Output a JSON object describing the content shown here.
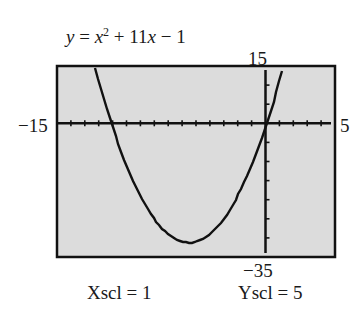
{
  "chart_data": {
    "type": "line",
    "function": "x^2 + 11x - 1",
    "equation_parts": {
      "y": "y",
      "eq": " = ",
      "x": "x",
      "exp": "2",
      "rest_a": " + 11",
      "x2": "x",
      "rest_b": " − 1"
    },
    "window": {
      "xmin": -15,
      "xmax": 5,
      "ymin": -35,
      "ymax": 15,
      "xscl": 1,
      "yscl": 5
    },
    "labels": {
      "xmin": "−15",
      "xmax": "5",
      "ymax": "15",
      "ymin": "−35",
      "xscl": "Xscl = 1",
      "yscl": "Yscl = 5"
    },
    "vertex": {
      "x": -5.5,
      "y": -31.25
    },
    "x_intercepts": [
      -11.09,
      0.09
    ],
    "y_intercept": -1,
    "grid": false,
    "legend": null,
    "colors": {
      "screen": "#dcdcdc",
      "frame": "#111111",
      "curve": "#111111",
      "axes": "#111111"
    }
  }
}
